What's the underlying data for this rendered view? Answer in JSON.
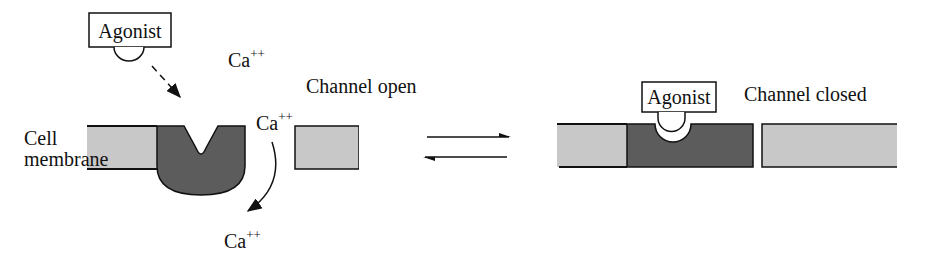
{
  "left_panel": {
    "agonist_label": "Agonist",
    "channel_state_label": "Channel open",
    "membrane_label_line1": "Cell",
    "membrane_label_line2": "membrane",
    "ion_top": "Ca",
    "ion_mid": "Ca",
    "ion_bottom": "Ca",
    "ion_charge": "++"
  },
  "right_panel": {
    "agonist_label": "Agonist",
    "channel_state_label": "Channel closed"
  },
  "equilibrium_arrows": "reversible",
  "colors": {
    "membrane_light": "#c8c8c8",
    "channel_dark": "#5c5c5c",
    "outline": "#111111"
  }
}
